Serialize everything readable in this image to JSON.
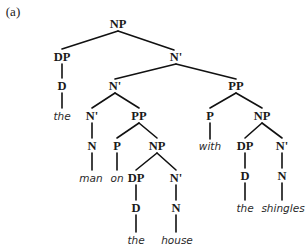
{
  "caption": "(a)",
  "colors": {
    "text": "#1a1a1a",
    "lines": "#111111",
    "background": "#ffffff"
  },
  "nodes": [
    {
      "id": "np_root",
      "label": "NP",
      "type": "category",
      "x": 118,
      "y": 24
    },
    {
      "id": "dp1",
      "label": "DP",
      "type": "category",
      "x": 62,
      "y": 57
    },
    {
      "id": "nbar1",
      "label": "N'",
      "type": "category",
      "x": 176,
      "y": 57
    },
    {
      "id": "d1",
      "label": "D",
      "type": "category",
      "x": 62,
      "y": 86
    },
    {
      "id": "nbar2",
      "label": "N'",
      "type": "category",
      "x": 115,
      "y": 86
    },
    {
      "id": "pp1",
      "label": "PP",
      "type": "category",
      "x": 236,
      "y": 86
    },
    {
      "id": "the1",
      "label": "the",
      "type": "word",
      "x": 62,
      "y": 116
    },
    {
      "id": "nbar3",
      "label": "N'",
      "type": "category",
      "x": 92,
      "y": 116
    },
    {
      "id": "pp2",
      "label": "PP",
      "type": "category",
      "x": 139,
      "y": 116
    },
    {
      "id": "p_with",
      "label": "P",
      "type": "category",
      "x": 210,
      "y": 116
    },
    {
      "id": "np3",
      "label": "NP",
      "type": "category",
      "x": 262,
      "y": 116
    },
    {
      "id": "n1",
      "label": "N",
      "type": "category",
      "x": 92,
      "y": 146
    },
    {
      "id": "p_on",
      "label": "P",
      "type": "category",
      "x": 117,
      "y": 146
    },
    {
      "id": "np2",
      "label": "NP",
      "type": "category",
      "x": 157,
      "y": 146
    },
    {
      "id": "with",
      "label": "with",
      "type": "word",
      "x": 210,
      "y": 146
    },
    {
      "id": "dp3",
      "label": "DP",
      "type": "category",
      "x": 245,
      "y": 146
    },
    {
      "id": "nbar5",
      "label": "N'",
      "type": "category",
      "x": 282,
      "y": 146
    },
    {
      "id": "man",
      "label": "man",
      "type": "word",
      "x": 91,
      "y": 178
    },
    {
      "id": "on",
      "label": "on",
      "type": "word",
      "x": 117,
      "y": 178
    },
    {
      "id": "dp2",
      "label": "DP",
      "type": "category",
      "x": 136,
      "y": 178
    },
    {
      "id": "nbar4",
      "label": "N'",
      "type": "category",
      "x": 176,
      "y": 178
    },
    {
      "id": "d3",
      "label": "D",
      "type": "category",
      "x": 245,
      "y": 176
    },
    {
      "id": "n3",
      "label": "N",
      "type": "category",
      "x": 282,
      "y": 176
    },
    {
      "id": "d2",
      "label": "D",
      "type": "category",
      "x": 136,
      "y": 208
    },
    {
      "id": "n2",
      "label": "N",
      "type": "category",
      "x": 176,
      "y": 208
    },
    {
      "id": "the3",
      "label": "the",
      "type": "word",
      "x": 245,
      "y": 208
    },
    {
      "id": "shingles",
      "label": "shingles",
      "type": "word",
      "x": 283,
      "y": 208
    },
    {
      "id": "the2",
      "label": "the",
      "type": "word",
      "x": 136,
      "y": 240
    },
    {
      "id": "house",
      "label": "house",
      "type": "word",
      "x": 177,
      "y": 240
    }
  ],
  "edges": [
    {
      "x1": 118,
      "y1": 31,
      "x2": 62,
      "y2": 49
    },
    {
      "x1": 118,
      "y1": 31,
      "x2": 174,
      "y2": 50
    },
    {
      "x1": 62,
      "y1": 64,
      "x2": 62,
      "y2": 78
    },
    {
      "x1": 62,
      "y1": 93,
      "x2": 62,
      "y2": 108
    },
    {
      "x1": 176,
      "y1": 64,
      "x2": 115,
      "y2": 79
    },
    {
      "x1": 176,
      "y1": 64,
      "x2": 236,
      "y2": 79
    },
    {
      "x1": 115,
      "y1": 93,
      "x2": 92,
      "y2": 108
    },
    {
      "x1": 115,
      "y1": 93,
      "x2": 139,
      "y2": 108
    },
    {
      "x1": 236,
      "y1": 93,
      "x2": 210,
      "y2": 108
    },
    {
      "x1": 236,
      "y1": 93,
      "x2": 262,
      "y2": 108
    },
    {
      "x1": 92,
      "y1": 123,
      "x2": 92,
      "y2": 138
    },
    {
      "x1": 139,
      "y1": 123,
      "x2": 117,
      "y2": 138
    },
    {
      "x1": 139,
      "y1": 123,
      "x2": 157,
      "y2": 138
    },
    {
      "x1": 210,
      "y1": 123,
      "x2": 210,
      "y2": 139
    },
    {
      "x1": 262,
      "y1": 123,
      "x2": 245,
      "y2": 138
    },
    {
      "x1": 262,
      "y1": 123,
      "x2": 282,
      "y2": 138
    },
    {
      "x1": 92,
      "y1": 153,
      "x2": 92,
      "y2": 170
    },
    {
      "x1": 117,
      "y1": 153,
      "x2": 117,
      "y2": 170
    },
    {
      "x1": 157,
      "y1": 153,
      "x2": 136,
      "y2": 170
    },
    {
      "x1": 157,
      "y1": 153,
      "x2": 176,
      "y2": 170
    },
    {
      "x1": 245,
      "y1": 153,
      "x2": 245,
      "y2": 168
    },
    {
      "x1": 282,
      "y1": 153,
      "x2": 282,
      "y2": 168
    },
    {
      "x1": 245,
      "y1": 183,
      "x2": 245,
      "y2": 200
    },
    {
      "x1": 282,
      "y1": 183,
      "x2": 282,
      "y2": 200
    },
    {
      "x1": 136,
      "y1": 185,
      "x2": 136,
      "y2": 200
    },
    {
      "x1": 176,
      "y1": 185,
      "x2": 176,
      "y2": 200
    },
    {
      "x1": 136,
      "y1": 215,
      "x2": 136,
      "y2": 232
    },
    {
      "x1": 176,
      "y1": 215,
      "x2": 176,
      "y2": 232
    }
  ]
}
